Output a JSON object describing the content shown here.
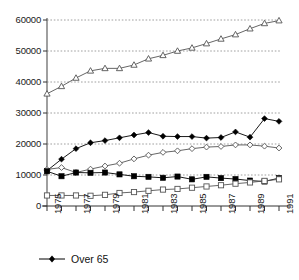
{
  "chart_data": {
    "type": "line",
    "title": "",
    "xlabel": "",
    "ylabel": "",
    "x": [
      1975,
      1976,
      1977,
      1978,
      1979,
      1980,
      1981,
      1982,
      1983,
      1984,
      1985,
      1986,
      1987,
      1988,
      1989,
      1990,
      1991
    ],
    "xtick_labels": [
      "1975",
      "",
      "1977",
      "",
      "1979",
      "",
      "1981",
      "",
      "1983",
      "",
      "1985",
      "",
      "1987",
      "",
      "1989",
      "",
      "1991"
    ],
    "xlim": [
      1975,
      1991
    ],
    "ylim": [
      0,
      60000
    ],
    "ytick_labels": [
      "0",
      "10000",
      "20000",
      "30000",
      "40000",
      "50000",
      "60000"
    ],
    "ytick_values": [
      0,
      10000,
      20000,
      30000,
      40000,
      50000,
      60000
    ],
    "grid": "horizontal-dashed",
    "legend_position": "bottom-left",
    "series": [
      {
        "name": "series-top",
        "marker": "open-triangle",
        "color": "#555555",
        "values": [
          36200,
          38600,
          41300,
          43600,
          44400,
          44400,
          45500,
          47500,
          48600,
          50000,
          51000,
          52400,
          53900,
          55300,
          57200,
          58900,
          59800
        ]
      },
      {
        "name": "Over 65",
        "marker": "filled-diamond",
        "color": "#000000",
        "values": [
          11400,
          15100,
          18500,
          20400,
          21100,
          22000,
          22900,
          23700,
          22500,
          22400,
          22400,
          21900,
          22100,
          23900,
          22200,
          28200,
          27300
        ]
      },
      {
        "name": "series-open-diamond",
        "marker": "open-diamond",
        "color": "#555555",
        "values": [
          11800,
          12400,
          10800,
          11900,
          12900,
          13800,
          15200,
          16400,
          17300,
          17800,
          18500,
          19000,
          19200,
          19700,
          19700,
          19300,
          18700
        ]
      },
      {
        "name": "series-filled-square",
        "marker": "filled-square",
        "color": "#000000",
        "values": [
          11200,
          9600,
          10800,
          10700,
          10800,
          10200,
          9600,
          9400,
          9100,
          9500,
          8600,
          9400,
          9000,
          8700,
          8200,
          7900,
          9000
        ]
      },
      {
        "name": "series-open-square",
        "marker": "open-square",
        "color": "#555555",
        "values": [
          3400,
          3400,
          3400,
          3300,
          3600,
          4200,
          4500,
          4900,
          5300,
          5500,
          5900,
          6300,
          6700,
          7200,
          7600,
          8100,
          8600
        ]
      }
    ]
  },
  "legend": {
    "entries": [
      {
        "label": "Over 65",
        "marker": "filled-diamond"
      }
    ]
  },
  "axes": {
    "y_axis_name": "value-axis",
    "x_axis_name": "year-axis"
  }
}
